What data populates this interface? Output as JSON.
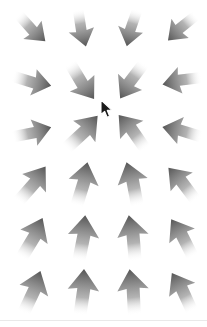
{
  "scene": {
    "title": "Arrow Direction Grid",
    "background_color": "#ffffff",
    "width": 207,
    "height": 327,
    "description": "A 6 by 4 grid of gray gradient arrows pointing in varying directions, with a mouse cursor near the center."
  },
  "arrow_style": {
    "head_color": "#555555",
    "tail_color": "#ffffff",
    "mid_color": "#9a9a9a",
    "name": "gradient-arrow"
  },
  "grid": {
    "rows": 6,
    "cols": 4,
    "col_x": [
      6,
      56,
      106,
      156
    ],
    "row_y": [
      2,
      55,
      106,
      158,
      212,
      266
    ],
    "cell_size": 52
  },
  "arrows": [
    {
      "id": "arrow-r1c1",
      "row": 1,
      "col": 1,
      "angle_deg": 135,
      "label": "down-right",
      "scale": 0.82
    },
    {
      "id": "arrow-r1c2",
      "row": 1,
      "col": 2,
      "angle_deg": 168,
      "label": "down",
      "scale": 0.82
    },
    {
      "id": "arrow-r1c3",
      "row": 1,
      "col": 3,
      "angle_deg": 196,
      "label": "down-slightly-left",
      "scale": 0.82
    },
    {
      "id": "arrow-r1c4",
      "row": 1,
      "col": 4,
      "angle_deg": 228,
      "label": "down-left",
      "scale": 0.82
    },
    {
      "id": "arrow-r2c1",
      "row": 2,
      "col": 1,
      "angle_deg": 104,
      "label": "right-slightly-down",
      "scale": 0.86
    },
    {
      "id": "arrow-r2c2",
      "row": 2,
      "col": 2,
      "angle_deg": 146,
      "label": "down-right",
      "scale": 0.94
    },
    {
      "id": "arrow-r2c3",
      "row": 2,
      "col": 3,
      "angle_deg": 214,
      "label": "down-left",
      "scale": 0.92
    },
    {
      "id": "arrow-r2c4",
      "row": 2,
      "col": 4,
      "angle_deg": 260,
      "label": "left-slightly-down",
      "scale": 0.86
    },
    {
      "id": "arrow-r3c1",
      "row": 3,
      "col": 1,
      "angle_deg": 76,
      "label": "right-slightly-up",
      "scale": 0.86
    },
    {
      "id": "arrow-r3c2",
      "row": 3,
      "col": 2,
      "angle_deg": 44,
      "label": "up-right",
      "scale": 0.98
    },
    {
      "id": "arrow-r3c3",
      "row": 3,
      "col": 3,
      "angle_deg": 322,
      "label": "up-left",
      "scale": 0.94
    },
    {
      "id": "arrow-r3c4",
      "row": 3,
      "col": 4,
      "angle_deg": 284,
      "label": "left-slightly-up",
      "scale": 0.88
    },
    {
      "id": "arrow-r4c1",
      "row": 4,
      "col": 1,
      "angle_deg": 38,
      "label": "up-right",
      "scale": 0.96
    },
    {
      "id": "arrow-r4c2",
      "row": 4,
      "col": 2,
      "angle_deg": 14,
      "label": "up-slightly-right",
      "scale": 0.98
    },
    {
      "id": "arrow-r4c3",
      "row": 4,
      "col": 3,
      "angle_deg": 346,
      "label": "up-slightly-left",
      "scale": 0.98
    },
    {
      "id": "arrow-r4c4",
      "row": 4,
      "col": 4,
      "angle_deg": 320,
      "label": "up-left",
      "scale": 0.92
    },
    {
      "id": "arrow-r5c1",
      "row": 5,
      "col": 1,
      "angle_deg": 28,
      "label": "up-right",
      "scale": 0.98
    },
    {
      "id": "arrow-r5c2",
      "row": 5,
      "col": 2,
      "angle_deg": 8,
      "label": "up",
      "scale": 1.0
    },
    {
      "id": "arrow-r5c3",
      "row": 5,
      "col": 3,
      "angle_deg": 352,
      "label": "up",
      "scale": 1.0
    },
    {
      "id": "arrow-r5c4",
      "row": 5,
      "col": 4,
      "angle_deg": 330,
      "label": "up-left",
      "scale": 0.94
    },
    {
      "id": "arrow-r6c1",
      "row": 6,
      "col": 1,
      "angle_deg": 22,
      "label": "up-slightly-right",
      "scale": 0.98
    },
    {
      "id": "arrow-r6c2",
      "row": 6,
      "col": 2,
      "angle_deg": 5,
      "label": "up",
      "scale": 1.0
    },
    {
      "id": "arrow-r6c3",
      "row": 6,
      "col": 3,
      "angle_deg": 354,
      "label": "up",
      "scale": 1.0
    },
    {
      "id": "arrow-r6c4",
      "row": 6,
      "col": 4,
      "angle_deg": 332,
      "label": "up-left",
      "scale": 0.94
    }
  ],
  "cursor": {
    "name": "mouse-pointer",
    "x": 100,
    "y": 99,
    "fill": "#1a1a1a",
    "stroke": "#ffffff"
  },
  "bottom_edge": {
    "y": 320,
    "color": "#e9e9e9"
  }
}
